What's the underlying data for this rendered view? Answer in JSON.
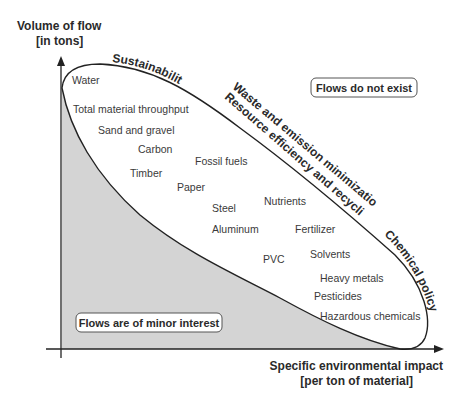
{
  "axes": {
    "y_title_line1": "Volume of flow",
    "y_title_line2": "[in tons]",
    "x_title_line1": "Specific environmental impact",
    "x_title_line2": "[per ton of material]"
  },
  "regions": {
    "upper_right": "Flows do not exist",
    "lower_left": "Flows are of minor interest"
  },
  "policy_labels": {
    "sustainability": "Sustainability",
    "waste": "Waste and emission minimization",
    "resource": "Resource efficiency and recycling",
    "chemical": "Chemical policy"
  },
  "materials": [
    {
      "label": "Water",
      "x": 72,
      "y": 84
    },
    {
      "label": "Total material throughput",
      "x": 73,
      "y": 113
    },
    {
      "label": "Sand and gravel",
      "x": 98,
      "y": 134
    },
    {
      "label": "Carbon",
      "x": 138,
      "y": 153
    },
    {
      "label": "Fossil fuels",
      "x": 195,
      "y": 165
    },
    {
      "label": "Timber",
      "x": 130,
      "y": 177
    },
    {
      "label": "Paper",
      "x": 177,
      "y": 191
    },
    {
      "label": "Steel",
      "x": 212,
      "y": 212
    },
    {
      "label": "Nutrients",
      "x": 264,
      "y": 205
    },
    {
      "label": "Aluminum",
      "x": 212,
      "y": 233
    },
    {
      "label": "Fertilizer",
      "x": 295,
      "y": 233
    },
    {
      "label": "PVC",
      "x": 263,
      "y": 263
    },
    {
      "label": "Solvents",
      "x": 310,
      "y": 258
    },
    {
      "label": "Heavy metals",
      "x": 320,
      "y": 282
    },
    {
      "label": "Pesticides",
      "x": 314,
      "y": 300
    },
    {
      "label": "Hazardous chemicals",
      "x": 320,
      "y": 320
    }
  ],
  "colors": {
    "shaded_region": "#d4d4d4",
    "line": "#222222",
    "text": "#3a3a3a"
  }
}
